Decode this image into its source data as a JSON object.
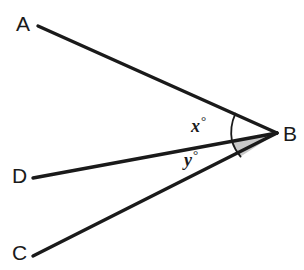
{
  "figure": {
    "type": "geometry-diagram",
    "background_color": "#ffffff",
    "stroke_color": "#1a1a1a",
    "shade_color": "#c8c8c8",
    "canvas": {
      "width": 304,
      "height": 270
    }
  },
  "vertices": {
    "A": {
      "label": "A",
      "x": 38,
      "y": 26
    },
    "B": {
      "label": "B",
      "x": 277,
      "y": 133
    },
    "C": {
      "label": "C",
      "x": 33,
      "y": 256
    },
    "D": {
      "label": "D",
      "x": 33,
      "y": 178
    }
  },
  "segments": [
    {
      "name": "segment-AB",
      "from": "A",
      "to": "B"
    },
    {
      "name": "segment-DB",
      "from": "D",
      "to": "B"
    },
    {
      "name": "segment-CB",
      "from": "C",
      "to": "B"
    }
  ],
  "angles": [
    {
      "name": "angle-x",
      "label": "x",
      "unit": "°",
      "at_vertex": "B",
      "between": [
        "A",
        "D"
      ],
      "marker": "arc",
      "filled": false
    },
    {
      "name": "angle-y",
      "label": "y",
      "unit": "°",
      "at_vertex": "B",
      "between": [
        "D",
        "C"
      ],
      "marker": "shaded-sector",
      "filled": true
    }
  ],
  "labels": {
    "A": "A",
    "B": "B",
    "C": "C",
    "D": "D",
    "x": "x",
    "y": "y",
    "degree": "°"
  }
}
